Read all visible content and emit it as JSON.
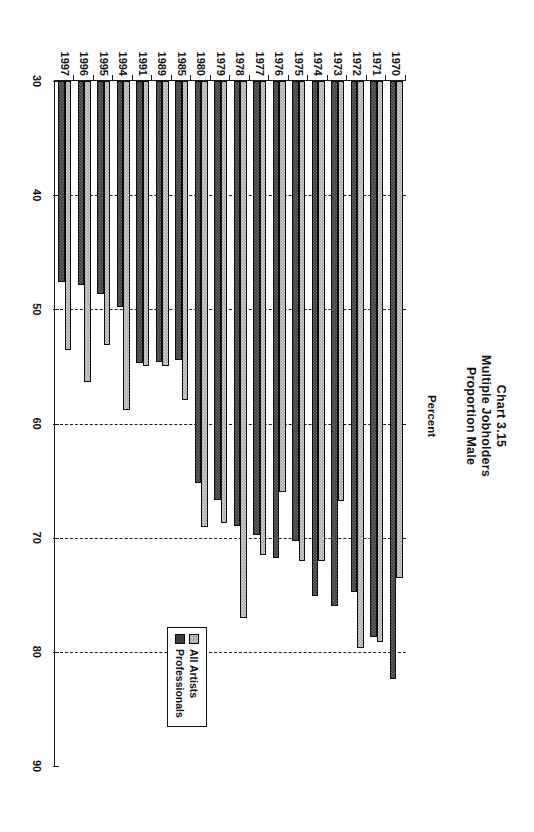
{
  "chart_data": {
    "type": "bar",
    "orientation": "horizontal",
    "title": "Chart 3.15",
    "subtitle_lines": [
      "Multiple Jobholders",
      "Proportion Male"
    ],
    "xlabel": "Percent",
    "ylabel": "",
    "xlim": [
      30,
      90
    ],
    "xticks": [
      30,
      40,
      50,
      60,
      70,
      80,
      90
    ],
    "grid": "vertical-dashed",
    "legend_position": "inside-lower-right",
    "categories": [
      "1970",
      "1971",
      "1972",
      "1973",
      "1974",
      "1975",
      "1976",
      "1977",
      "1978",
      "1979",
      "1980",
      "1985",
      "1989",
      "1991",
      "1994",
      "1995",
      "1996",
      "1997"
    ],
    "series": [
      {
        "name": "All Artists",
        "color": "#a9a9a9",
        "values": [
          73.5,
          79.1,
          79.7,
          66.8,
          72.0,
          72.0,
          66.0,
          71.5,
          77.0,
          68.7,
          69.1,
          57.9,
          55.0,
          55.0,
          58.8,
          53.1,
          56.4,
          53.6
        ]
      },
      {
        "name": "Professionals",
        "color": "#3d3d3d",
        "values": [
          82.4,
          78.7,
          74.8,
          76.0,
          75.1,
          70.3,
          71.8,
          69.8,
          69.0,
          66.7,
          65.2,
          54.4,
          54.6,
          54.7,
          49.8,
          48.7,
          47.9,
          47.6
        ]
      }
    ]
  },
  "legend": {
    "entries": [
      {
        "label": "All Artists"
      },
      {
        "label": "Professionals"
      }
    ]
  }
}
